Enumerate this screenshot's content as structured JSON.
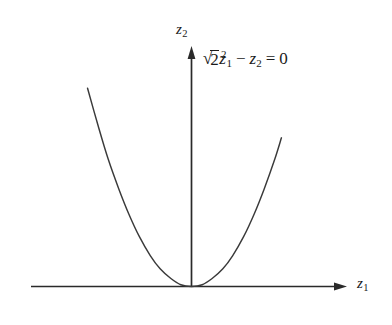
{
  "figure": {
    "background_color": "#ffffff",
    "ink_color": "#1a1a1a",
    "width": 392,
    "height": 325
  },
  "axes": {
    "horizontal": {
      "label_var": "z",
      "label_sub": "1",
      "arrow": "right-arrow-icon"
    },
    "vertical": {
      "label_var": "z",
      "label_sub": "2",
      "arrow": "up-arrow-icon"
    }
  },
  "annotation": {
    "radical_glyph": "√",
    "radicand": "2",
    "var": "z",
    "var_sub": "1",
    "var_sup": "2",
    "minus": "−",
    "var2": "z",
    "var2_sub": "2",
    "equals": "=",
    "rhs": "0",
    "plain_text": "√2 z₁² − z₂ = 0"
  },
  "chart_data": {
    "type": "line",
    "title": "",
    "subtitle": "",
    "xlabel": "z₁",
    "ylabel": "z₂",
    "annotations": [
      "√2 z₁² − z₂ = 0"
    ],
    "grid": false,
    "legend": null,
    "axis_style": "arrowed-cartesian-axes-through-origin",
    "xlim": [
      -1.26,
      1.26
    ],
    "ylim": [
      0,
      2.24
    ],
    "equation": "z2 = sqrt(2) * z1^2",
    "coefficient": 1.4142,
    "vertex": [
      0,
      0
    ],
    "series": [
      {
        "name": "√2 z₁² − z₂ = 0",
        "x": [
          -1.26,
          -1.13,
          -1.01,
          -0.88,
          -0.76,
          -0.63,
          -0.5,
          -0.38,
          -0.25,
          -0.13,
          0.0,
          0.13,
          0.25,
          0.38,
          0.5,
          0.63,
          0.76,
          0.88,
          1.01,
          1.09
        ],
        "y": [
          2.24,
          1.81,
          1.44,
          1.1,
          0.82,
          0.56,
          0.35,
          0.2,
          0.09,
          0.02,
          0.0,
          0.02,
          0.09,
          0.2,
          0.35,
          0.56,
          0.82,
          1.1,
          1.44,
          1.68
        ]
      }
    ]
  }
}
